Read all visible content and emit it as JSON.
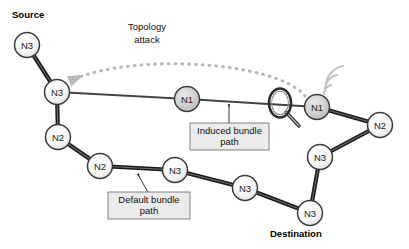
{
  "diagram": {
    "canvas": {
      "width": 409,
      "height": 249,
      "background": "#ffffff"
    },
    "colors": {
      "node_fill_light": "#f2f2f2",
      "node_fill_gray": "#cccccc",
      "node_stroke": "#3a3a3a",
      "edge_thick": "#1a1a1a",
      "edge_thin": "#444444",
      "attack_arc": "#b8b8b8",
      "wireless_arc": "#c0c0c0",
      "callout_fill": "#ebebeb",
      "callout_stroke": "#777777",
      "leader_line": "#333333"
    },
    "nodes": [
      {
        "id": "n_src",
        "label": "N3",
        "x": 27,
        "y": 45,
        "r": 12.5,
        "style": "light"
      },
      {
        "id": "n_hub",
        "label": "N3",
        "x": 57,
        "y": 92,
        "r": 12.5,
        "style": "light"
      },
      {
        "id": "n_mid1",
        "label": "N1",
        "x": 187,
        "y": 99,
        "r": 12.5,
        "style": "gray"
      },
      {
        "id": "n_rt1",
        "label": "N1",
        "x": 317,
        "y": 107,
        "r": 12.5,
        "style": "gray"
      },
      {
        "id": "n_rt2",
        "label": "N2",
        "x": 380,
        "y": 125,
        "r": 12.5,
        "style": "light"
      },
      {
        "id": "n_rt3",
        "label": "N3",
        "x": 320,
        "y": 157,
        "r": 12.5,
        "style": "light"
      },
      {
        "id": "n_dest",
        "label": "N3",
        "x": 310,
        "y": 213,
        "r": 12.5,
        "style": "light"
      },
      {
        "id": "n_lw1",
        "label": "N2",
        "x": 58,
        "y": 137,
        "r": 12.5,
        "style": "light"
      },
      {
        "id": "n_lw2",
        "label": "N2",
        "x": 100,
        "y": 166,
        "r": 12.5,
        "style": "light"
      },
      {
        "id": "n_bm1",
        "label": "N3",
        "x": 175,
        "y": 170,
        "r": 12.5,
        "style": "light"
      },
      {
        "id": "n_bm2",
        "label": "N3",
        "x": 245,
        "y": 188,
        "r": 12.5,
        "style": "light"
      }
    ],
    "edges": [
      {
        "from": "n_src",
        "to": "n_hub",
        "weight": "thick"
      },
      {
        "from": "n_hub",
        "to": "n_mid1",
        "weight": "thin"
      },
      {
        "from": "n_mid1",
        "to": "n_rt1",
        "weight": "thin"
      },
      {
        "from": "n_hub",
        "to": "n_lw1",
        "weight": "thick"
      },
      {
        "from": "n_lw1",
        "to": "n_lw2",
        "weight": "thick"
      },
      {
        "from": "n_lw2",
        "to": "n_bm1",
        "weight": "thick"
      },
      {
        "from": "n_bm1",
        "to": "n_bm2",
        "weight": "thick"
      },
      {
        "from": "n_bm2",
        "to": "n_dest",
        "weight": "thick"
      },
      {
        "from": "n_rt1",
        "to": "n_rt2",
        "weight": "thick"
      },
      {
        "from": "n_rt2",
        "to": "n_rt3",
        "weight": "thick"
      },
      {
        "from": "n_rt3",
        "to": "n_dest",
        "weight": "thick"
      }
    ],
    "endpoint_labels": [
      {
        "id": "source_label",
        "text": "Source",
        "x": 12,
        "y": 18
      },
      {
        "id": "destination_label",
        "text": "Destination",
        "x": 270,
        "y": 237
      }
    ],
    "annotations": {
      "attack": {
        "line1": "Topology",
        "line2": "attack",
        "x": 147,
        "y1": 30,
        "y2": 43
      }
    },
    "callouts": [
      {
        "id": "induced-bundle-path",
        "line1": "Induced bundle",
        "line2": "path",
        "box": {
          "x": 190,
          "y": 123,
          "w": 79,
          "h": 27
        },
        "leader": {
          "x1": 229,
          "y1": 123,
          "x2": 229,
          "y2": 110,
          "tipx": 229,
          "tipy": 104
        }
      },
      {
        "id": "default-bundle-path",
        "line1": "Default bundle",
        "line2": "path",
        "box": {
          "x": 108,
          "y": 192,
          "w": 82,
          "h": 27
        },
        "leader": {
          "x1": 148,
          "y1": 192,
          "x2": 141,
          "y2": 180,
          "tipx": 138,
          "tipy": 174
        }
      }
    ],
    "icons": {
      "magnifier": {
        "cx": 280,
        "cy": 103,
        "rx": 11,
        "ry": 14
      },
      "wireless": {
        "cx": 322,
        "cy": 97,
        "arcs": 3
      }
    }
  }
}
